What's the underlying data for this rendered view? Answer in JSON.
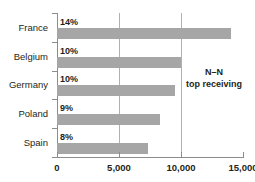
{
  "chart_data": {
    "type": "bar",
    "orientation": "horizontal",
    "title": "",
    "xlabel": "",
    "ylabel": "",
    "categories": [
      "France",
      "Belgium",
      "Germany",
      "Poland",
      "Spain"
    ],
    "values": [
      14000,
      10000,
      9500,
      8300,
      7300
    ],
    "data_labels": [
      "14%",
      "10%",
      "10%",
      "9%",
      "8%"
    ],
    "xlim": [
      0,
      15000
    ],
    "xticks": [
      0,
      5000,
      10000,
      15000
    ],
    "xtick_labels": [
      "0",
      "5,000",
      "10,000",
      "15,000"
    ],
    "gridlines": [
      5000,
      10000
    ],
    "grid": true,
    "legend": "none",
    "bar_color": "#a6a6a6",
    "annotations": [
      {
        "line1": "N–N",
        "line2": "top receiving"
      }
    ]
  },
  "annotation": {
    "line1": "N–N",
    "line2": "top receiving"
  }
}
